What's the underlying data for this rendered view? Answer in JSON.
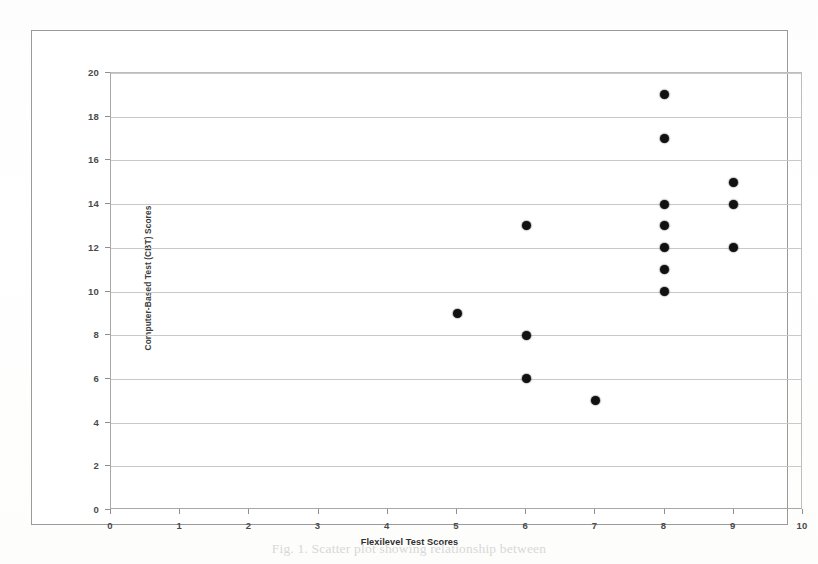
{
  "figure": {
    "caption": "Fig. 1. Scatter plot showing relationship between"
  },
  "chart_data": {
    "type": "scatter",
    "title": "",
    "xlabel": "Flexilevel Test Scores",
    "ylabel": "Computer-Based Test (CBT) Scores",
    "xlim": [
      0,
      10
    ],
    "ylim": [
      0,
      20
    ],
    "xticks": [
      0,
      1,
      2,
      3,
      4,
      5,
      6,
      7,
      8,
      9,
      10
    ],
    "yticks": [
      0,
      2,
      4,
      6,
      8,
      10,
      12,
      14,
      16,
      18,
      20
    ],
    "xtick_labels": [
      "0",
      "1",
      "2",
      "3",
      "4",
      "5",
      "6",
      "7",
      "8",
      "9",
      "10"
    ],
    "ytick_labels": [
      "0",
      "2",
      "4",
      "6",
      "8",
      "10",
      "12",
      "14",
      "16",
      "18",
      "20"
    ],
    "grid": "horizontal",
    "legend": null,
    "marker_color": "#111111",
    "points": [
      {
        "x": 5,
        "y": 9
      },
      {
        "x": 6,
        "y": 13
      },
      {
        "x": 6,
        "y": 8
      },
      {
        "x": 6,
        "y": 6
      },
      {
        "x": 7,
        "y": 5
      },
      {
        "x": 8,
        "y": 19
      },
      {
        "x": 8,
        "y": 17
      },
      {
        "x": 8,
        "y": 14
      },
      {
        "x": 8,
        "y": 13
      },
      {
        "x": 8,
        "y": 12
      },
      {
        "x": 8,
        "y": 11
      },
      {
        "x": 8,
        "y": 10
      },
      {
        "x": 9,
        "y": 15
      },
      {
        "x": 9,
        "y": 14
      },
      {
        "x": 9,
        "y": 12
      }
    ]
  }
}
